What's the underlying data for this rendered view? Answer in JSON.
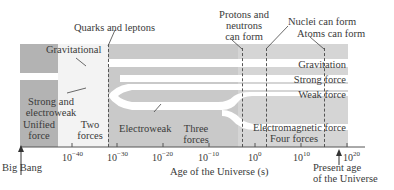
{
  "diagram": {
    "axis": {
      "label": "Age of the Universe (s)",
      "ticks": [
        {
          "base": "10",
          "exp": "−40"
        },
        {
          "base": "10",
          "exp": "−30"
        },
        {
          "base": "10",
          "exp": "−20"
        },
        {
          "base": "10",
          "exp": "−10"
        },
        {
          "base": "10",
          "exp": "0"
        },
        {
          "base": "10",
          "exp": "10"
        },
        {
          "base": "10",
          "exp": "20"
        }
      ],
      "start_marker": "Big Bang",
      "end_marker_line1": "Present age",
      "end_marker_line2": "of the Universe"
    },
    "events": {
      "quarks": "Quarks and leptons",
      "protons_line1": "Protons and",
      "protons_line2": "neutrons",
      "protons_line3": "can form",
      "nuclei": "Nuclei can form",
      "atoms": "Atoms can form"
    },
    "eras": {
      "unified_line1": "Unified",
      "unified_line2": "force",
      "two_line1": "Two",
      "two_line2": "forces",
      "electroweak": "Electroweak",
      "three_line1": "Three",
      "three_line2": "forces",
      "four": "Four forces"
    },
    "forces": {
      "gravitational": "Gravitational",
      "strong_electroweak_line1": "Strong and",
      "strong_electroweak_line2": "electroweak",
      "gravitation": "Gravitation",
      "strong": "Strong force",
      "weak": "Weak force",
      "electromagnetic": "Electromagnetic force"
    },
    "colors": {
      "unified_band": "#b3b3b3",
      "two_forces_band": "#f4f4f4",
      "three_forces_band": "#c8c8c8",
      "four_forces_band": "#d4d4d4",
      "stripe": "#ffffff",
      "text": "#3a3a3a"
    }
  }
}
